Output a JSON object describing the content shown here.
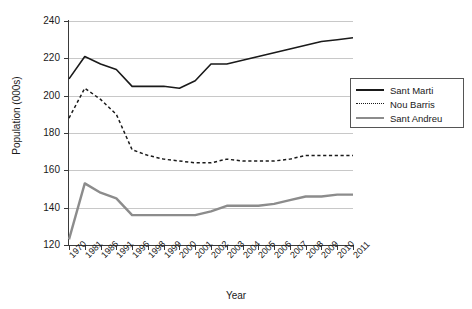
{
  "chart_data": {
    "type": "line",
    "title": "",
    "xlabel": "Year",
    "ylabel": "Population (000s)",
    "categories": [
      "1970",
      "1981",
      "1986",
      "1991",
      "1996",
      "1998",
      "1999",
      "2000",
      "2001",
      "2002",
      "2003",
      "2004",
      "2005",
      "2006",
      "2007",
      "2008",
      "2009",
      "2010",
      "2011"
    ],
    "ylim": [
      120,
      240
    ],
    "yticks": [
      120,
      140,
      160,
      180,
      200,
      220,
      240
    ],
    "grid": true,
    "legend_position": "right",
    "series": [
      {
        "name": "Sant Marti",
        "style": "solid",
        "color": "#1a1a1a",
        "values": [
          209,
          221,
          217,
          214,
          205,
          205,
          205,
          204,
          208,
          217,
          217,
          219,
          221,
          223,
          225,
          227,
          229,
          230,
          231
        ]
      },
      {
        "name": "Nou Barris",
        "style": "dashed",
        "color": "#1a1a1a",
        "values": [
          188,
          204,
          198,
          190,
          171,
          168,
          166,
          165,
          164,
          164,
          166,
          165,
          165,
          165,
          166,
          168,
          168,
          168,
          168
        ]
      },
      {
        "name": "Sant Andreu",
        "style": "solid-thick",
        "color": "#8c8c8c",
        "values": [
          123,
          153,
          148,
          145,
          136,
          136,
          136,
          136,
          136,
          138,
          141,
          141,
          141,
          142,
          144,
          146,
          146,
          147,
          147
        ]
      }
    ]
  },
  "legend": {
    "items": [
      {
        "label": "Sant Marti"
      },
      {
        "label": "Nou Barris"
      },
      {
        "label": "Sant Andreu"
      }
    ]
  }
}
